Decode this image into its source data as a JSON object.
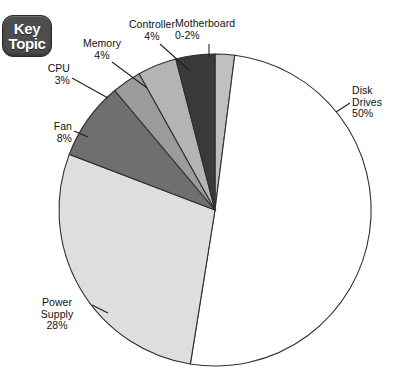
{
  "badge": {
    "name": "key-topic-badge",
    "line1": "Key",
    "line2": "Topic",
    "background_color": "#4d4d4d",
    "text_color": "#ffffff"
  },
  "chart_data": {
    "type": "pie",
    "title": "",
    "subtitle": "",
    "xlabel": "",
    "ylabel": "",
    "grid": false,
    "legend_position": "callout-labels",
    "start_angle_deg": 0,
    "direction": "clockwise",
    "center": {
      "x": 215,
      "y": 210
    },
    "radius": 156,
    "categories": [
      "Motherboard",
      "Disk Drives",
      "Power Supply",
      "Fan",
      "CPU",
      "Memory",
      "Controller"
    ],
    "values": [
      2,
      50,
      28,
      8,
      3,
      4,
      4
    ],
    "value_labels": [
      "0-2%",
      "50%",
      "28%",
      "8%",
      "3%",
      "4%",
      "4%"
    ],
    "colors": [
      "#c0c0c0",
      "#ffffff",
      "#dedede",
      "#6f6f6f",
      "#9b9b9b",
      "#b4b4b4",
      "#3a3a3a"
    ],
    "slices": [
      {
        "label": "Motherboard",
        "value": 2,
        "value_label": "0-2%",
        "color": "#c0c0c0"
      },
      {
        "label": "Disk Drives",
        "value": 50,
        "value_label": "50%",
        "color": "#ffffff"
      },
      {
        "label": "Power Supply",
        "value": 28,
        "value_label": "28%",
        "color": "#dedede"
      },
      {
        "label": "Fan",
        "value": 8,
        "value_label": "8%",
        "color": "#6f6f6f"
      },
      {
        "label": "CPU",
        "value": 3,
        "value_label": "3%",
        "color": "#9b9b9b"
      },
      {
        "label": "Memory",
        "value": 4,
        "value_label": "4%",
        "color": "#b4b4b4"
      },
      {
        "label": "Controller",
        "value": 4,
        "value_label": "4%",
        "color": "#3a3a3a"
      }
    ]
  },
  "callouts": {
    "cpu": {
      "text": "CPU\n3%"
    },
    "memory": {
      "text": "Memory\n4%"
    },
    "controller": {
      "text": "Controller\n4%"
    },
    "motherboard": {
      "text": "Motherboard\n0-2%"
    },
    "disk_drives": {
      "text": "Disk\nDrives\n50%"
    },
    "power_supply": {
      "text": "Power\nSupply\n28%"
    },
    "fan": {
      "text": "Fan\n8%"
    }
  },
  "style": {
    "background_color": "#ffffff",
    "outline_color": "#2f2f2f",
    "text_color": "#121212"
  }
}
